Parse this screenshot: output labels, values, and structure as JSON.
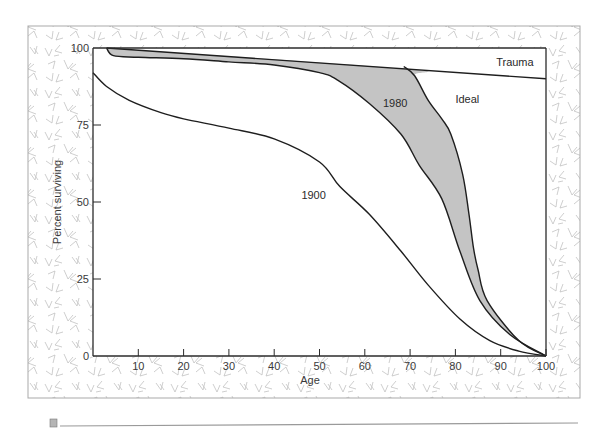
{
  "chart_data": {
    "type": "line",
    "title": "",
    "xlabel": "Age",
    "ylabel": "Percent surviving",
    "xlim": [
      0,
      100
    ],
    "ylim": [
      0,
      100
    ],
    "xticks": [
      10,
      20,
      30,
      40,
      50,
      60,
      70,
      80,
      90,
      100
    ],
    "yticks": [
      0,
      25,
      50,
      75,
      100
    ],
    "grid": false,
    "legend": "none (inline curve labels)",
    "shaded_region": {
      "between": [
        "1980",
        "Ideal"
      ],
      "color": "#c4c4c4"
    },
    "series": [
      {
        "name": "1900",
        "label": "1900",
        "points": [
          [
            0,
            92
          ],
          [
            3,
            87.5
          ],
          [
            8,
            83
          ],
          [
            15,
            79
          ],
          [
            20,
            77
          ],
          [
            30,
            74
          ],
          [
            40,
            70.5
          ],
          [
            50,
            63
          ],
          [
            54.5,
            55
          ],
          [
            61,
            46
          ],
          [
            68,
            34
          ],
          [
            74,
            23
          ],
          [
            81,
            12
          ],
          [
            87.6,
            5
          ],
          [
            94,
            1.6
          ],
          [
            100,
            0
          ]
        ]
      },
      {
        "name": "1980",
        "label": "1980",
        "points": [
          [
            3,
            100
          ],
          [
            4.5,
            97.5
          ],
          [
            10,
            97
          ],
          [
            20,
            96.5
          ],
          [
            30,
            95.5
          ],
          [
            40,
            94.5
          ],
          [
            50,
            92
          ],
          [
            54,
            89.6
          ],
          [
            61,
            82
          ],
          [
            68,
            72
          ],
          [
            72,
            62
          ],
          [
            77,
            51
          ],
          [
            81,
            34
          ],
          [
            85.4,
            18
          ],
          [
            92,
            7
          ],
          [
            100,
            0
          ]
        ]
      },
      {
        "name": "Ideal",
        "label": "Ideal",
        "points": [
          [
            68.6,
            94
          ],
          [
            71,
            91
          ],
          [
            74,
            83
          ],
          [
            77,
            77
          ],
          [
            79,
            72
          ],
          [
            81.6,
            59
          ],
          [
            83,
            46
          ],
          [
            84,
            35
          ],
          [
            85,
            28
          ],
          [
            87,
            18
          ],
          [
            94,
            5
          ],
          [
            100,
            0
          ]
        ]
      },
      {
        "name": "Trauma",
        "label": "Trauma",
        "points": [
          [
            3,
            100
          ],
          [
            100,
            90
          ]
        ]
      }
    ],
    "labels": [
      {
        "text": "1900",
        "x": 46,
        "y": 51
      },
      {
        "text": "1980",
        "x": 64,
        "y": 81
      },
      {
        "text": "Ideal",
        "x": 80,
        "y": 82
      },
      {
        "text": "Trauma",
        "x": 89,
        "y": 94
      }
    ]
  },
  "colors": {
    "frame_texture": "#bdbdbd",
    "frame_border": "#a9a9a9",
    "axis": "#2b2b2b",
    "curve": "#1e1e1e",
    "shade": "#c4c4c4",
    "footer_rule": "#9a9a9a"
  }
}
